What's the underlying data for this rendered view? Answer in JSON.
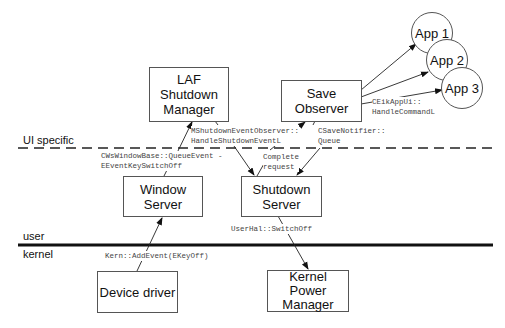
{
  "zones": {
    "ui_specific": "UI specific",
    "user": "user",
    "kernel": "kernel"
  },
  "boxes": {
    "laf": "LAF\nShutdown\nManager",
    "save_observer": "Save\nObserver",
    "window_server": "Window\nServer",
    "shutdown_server": "Shutdown\nServer",
    "device_driver": "Device driver",
    "kernel_power_manager": "Kernel\nPower\nManager"
  },
  "apps": [
    "App 1",
    "App 2",
    "App 3"
  ],
  "labels": {
    "handle_shutdown": "MShutdownEventObserver::\nHandleShutdownEventL",
    "save_notifier": "CSaveNotifier::\nQueue",
    "handle_command": "CEikAppUi::\nHandleCommandL",
    "queue_event": "CWsWindowBase::QueueEvent -\nEEventKeySwitchOff",
    "complete_request": "Complete\nrequest",
    "switch_off": "UserHal::SwitchOff",
    "add_event": "Kern::AddEvent(EKeyOff)"
  },
  "colors": {
    "line": "#222222",
    "box_border": "#555555",
    "background": "#ffffff"
  }
}
